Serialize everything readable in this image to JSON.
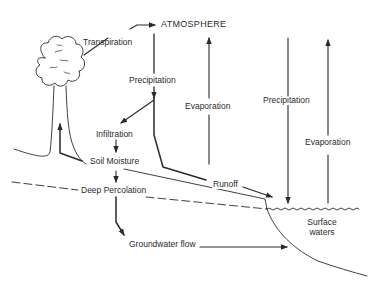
{
  "diagram": {
    "type": "hydrologic-cycle",
    "colors": {
      "line": "#2a2a2a",
      "background": "#ffffff"
    },
    "nodes": {
      "atmosphere": "ATMOSPHERE",
      "transpiration": "Transpiration",
      "precipitation_land": "Precipitation",
      "evaporation_land": "Evaporation",
      "precipitation_water": "Precipitation",
      "evaporation_water": "Evaporation",
      "infiltration": "Infiltration",
      "soil_moisture": "Soil Moisture",
      "deep_percolation": "Deep Percolation",
      "runoff": "Runoff",
      "groundwater_flow": "Groundwater flow",
      "surface_waters_line1": "Surface",
      "surface_waters_line2": "waters"
    },
    "edges": [
      {
        "from": "Tree",
        "to": "Atmosphere",
        "label": "Transpiration"
      },
      {
        "from": "Atmosphere",
        "to": "Land",
        "label": "Precipitation"
      },
      {
        "from": "Land",
        "to": "Atmosphere",
        "label": "Evaporation"
      },
      {
        "from": "Atmosphere",
        "to": "Surface waters",
        "label": "Precipitation"
      },
      {
        "from": "Surface waters",
        "to": "Atmosphere",
        "label": "Evaporation"
      },
      {
        "from": "Precipitation",
        "to": "Infiltration"
      },
      {
        "from": "Infiltration",
        "to": "Soil Moisture"
      },
      {
        "from": "Soil Moisture",
        "to": "Tree"
      },
      {
        "from": "Soil Moisture",
        "to": "Deep Percolation"
      },
      {
        "from": "Deep Percolation",
        "to": "Groundwater flow"
      },
      {
        "from": "Groundwater flow",
        "to": "Surface waters"
      },
      {
        "from": "Precipitation",
        "to": "Surface waters",
        "label": "Runoff"
      }
    ]
  }
}
